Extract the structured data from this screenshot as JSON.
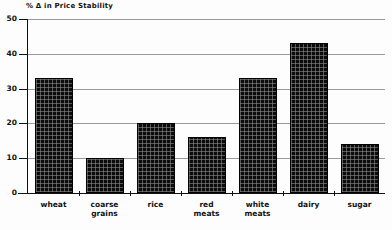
{
  "chart_data": {
    "type": "bar",
    "title": "% Δ in Price Stability",
    "xlabel": "",
    "ylabel": "",
    "ylim": [
      0,
      50
    ],
    "yticks": [
      0,
      10,
      20,
      30,
      40,
      50
    ],
    "grid": true,
    "legend": "none",
    "categories": [
      "wheat",
      "coarse\ngrains",
      "rice",
      "red\nmeats",
      "white\nmeats",
      "dairy",
      "sugar"
    ],
    "values": [
      33,
      10,
      20,
      16,
      33,
      43,
      14
    ]
  }
}
